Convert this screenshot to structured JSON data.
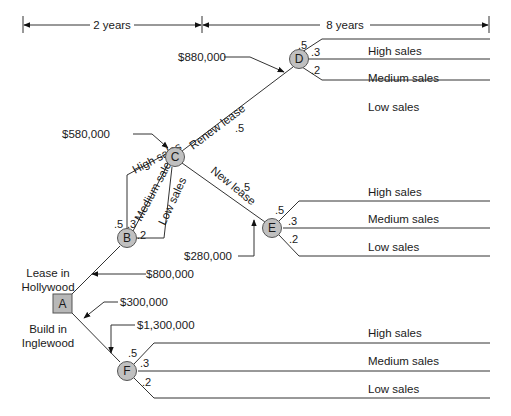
{
  "timeline": {
    "period1_label": "2 years",
    "period2_label": "8 years"
  },
  "colors": {
    "node_fill": "#c0c0c0",
    "line": "#333333",
    "text": "#1a1a1a"
  },
  "nodes": {
    "A": {
      "label": "A",
      "type": "decision"
    },
    "B": {
      "label": "B",
      "type": "chance"
    },
    "C": {
      "label": "C",
      "type": "decision-chance"
    },
    "D": {
      "label": "D",
      "type": "chance"
    },
    "E": {
      "label": "E",
      "type": "chance"
    },
    "F": {
      "label": "F",
      "type": "chance"
    }
  },
  "decisions": {
    "lease": "Lease in",
    "lease2": "Hollywood",
    "build": "Build in",
    "build2": "Inglewood",
    "renew": "Renew lease",
    "new": "New lease"
  },
  "costs": {
    "lease_hollywood": "$800,000",
    "build_inglewood": "$300,000",
    "node_f": "$1,300,000",
    "node_c": "$580,000",
    "node_d": "$880,000",
    "node_e": "$280,000"
  },
  "b_branches": {
    "high": {
      "label": "High sales",
      "prob": ".5"
    },
    "medium": {
      "label": "Medium sales",
      "prob": ".3"
    },
    "low": {
      "label": "Low sales",
      "prob": ".2"
    }
  },
  "c_branches": {
    "renew_prob": ".5",
    "new_prob": ".5"
  },
  "d_branches": {
    "high": {
      "label": "High sales",
      "prob": ".5"
    },
    "medium": {
      "label": "Medium sales",
      "prob": ".3"
    },
    "low": {
      "label": "Low sales",
      "prob": ".2"
    }
  },
  "e_branches": {
    "high": {
      "label": "High sales",
      "prob": ".5"
    },
    "medium": {
      "label": "Medium sales",
      "prob": ".3"
    },
    "low": {
      "label": "Low sales",
      "prob": ".2"
    }
  },
  "f_branches": {
    "high": {
      "label": "High sales",
      "prob": ".5"
    },
    "medium": {
      "label": "Medium sales",
      "prob": ".3"
    },
    "low": {
      "label": "Low sales",
      "prob": ".2"
    }
  }
}
